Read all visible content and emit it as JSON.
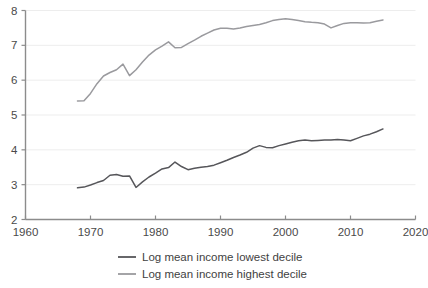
{
  "chart_data": {
    "type": "line",
    "title": "",
    "subtitle": "",
    "xlabel": "",
    "ylabel": "",
    "xlim": [
      1960,
      2020
    ],
    "ylim": [
      2,
      8
    ],
    "xticks": [
      1960,
      1970,
      1980,
      1990,
      2000,
      2010,
      2020
    ],
    "yticks": [
      2,
      3,
      4,
      5,
      6,
      7,
      8
    ],
    "xtick_labels": [
      "1960",
      "1970",
      "1980",
      "1990",
      "2000",
      "2010",
      "2020"
    ],
    "ytick_labels": [
      "2",
      "3",
      "4",
      "5",
      "6",
      "7",
      "8"
    ],
    "grid": "horizontal",
    "legend_position": "bottom",
    "x": [
      1968,
      1969,
      1970,
      1971,
      1972,
      1973,
      1974,
      1975,
      1976,
      1977,
      1978,
      1979,
      1980,
      1981,
      1982,
      1983,
      1984,
      1985,
      1986,
      1987,
      1988,
      1989,
      1990,
      1991,
      1992,
      1993,
      1994,
      1995,
      1996,
      1997,
      1998,
      1999,
      2000,
      2001,
      2002,
      2003,
      2004,
      2005,
      2006,
      2007,
      2008,
      2009,
      2010,
      2011,
      2012,
      2013,
      2014,
      2015
    ],
    "series": [
      {
        "name": "Log mean income lowest decile",
        "color": "#56565a",
        "values": [
          2.91,
          2.93,
          2.99,
          3.06,
          3.12,
          3.27,
          3.29,
          3.24,
          3.25,
          2.92,
          3.08,
          3.22,
          3.33,
          3.45,
          3.49,
          3.65,
          3.52,
          3.43,
          3.47,
          3.5,
          3.52,
          3.56,
          3.63,
          3.7,
          3.78,
          3.85,
          3.93,
          4.05,
          4.12,
          4.07,
          4.06,
          4.12,
          4.17,
          4.22,
          4.26,
          4.28,
          4.26,
          4.27,
          4.28,
          4.28,
          4.3,
          4.28,
          4.26,
          4.33,
          4.4,
          4.45,
          4.52,
          4.6
        ]
      },
      {
        "name": "Log mean income highest decile",
        "color": "#9a9a9e",
        "values": [
          5.4,
          5.41,
          5.62,
          5.9,
          6.12,
          6.22,
          6.3,
          6.46,
          6.13,
          6.3,
          6.52,
          6.72,
          6.87,
          6.98,
          7.1,
          6.93,
          6.94,
          7.05,
          7.15,
          7.26,
          7.35,
          7.44,
          7.49,
          7.49,
          7.47,
          7.5,
          7.54,
          7.57,
          7.6,
          7.65,
          7.71,
          7.74,
          7.76,
          7.74,
          7.71,
          7.68,
          7.66,
          7.65,
          7.61,
          7.5,
          7.57,
          7.63,
          7.65,
          7.65,
          7.64,
          7.65,
          7.69,
          7.73
        ]
      }
    ]
  },
  "legend": {
    "items": [
      {
        "label": "Log mean income lowest decile",
        "color": "#56565a"
      },
      {
        "label": "Log mean income highest decile",
        "color": "#9a9a9e"
      }
    ]
  },
  "style": {
    "background": "#ffffff",
    "grid_color": "#e8e8e8",
    "axis_color": "#8c8c8c",
    "text_color": "#4a4a4a"
  }
}
